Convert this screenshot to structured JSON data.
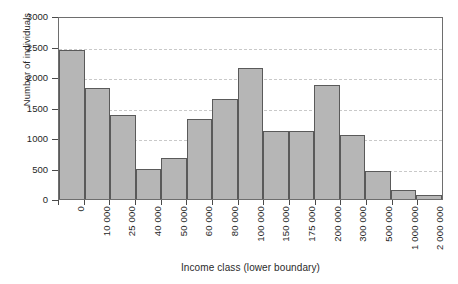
{
  "chart_data": {
    "type": "bar",
    "title": "",
    "xlabel": "Income class (lower boundary)",
    "ylabel": "Number of individuals",
    "categories": [
      "0",
      "10 000",
      "25 000",
      "40 000",
      "50 000",
      "60 000",
      "80 000",
      "100 000",
      "150 000",
      "175 000",
      "200 000",
      "300 000",
      "500 000",
      "1 000 000",
      "2 000 000"
    ],
    "values": [
      2450,
      1820,
      1370,
      490,
      670,
      1310,
      1640,
      2150,
      1120,
      1120,
      1870,
      1050,
      460,
      140,
      60
    ],
    "ylim": [
      0,
      3000
    ],
    "yticks": [
      0,
      500,
      1000,
      1500,
      2000,
      2500,
      3000
    ],
    "ytick_labels": [
      "0",
      "500",
      "1000",
      "1500",
      "2000",
      "2500",
      "3000"
    ],
    "grid": true,
    "grid_axis": "y",
    "legend": null,
    "bar_fill_color": "#b6b6b6",
    "bar_edge_color": "#5a5a5a",
    "gridline_color": "#c9c9c9",
    "axis_color": "#6e6e6e",
    "xtick_rotation": 90
  }
}
